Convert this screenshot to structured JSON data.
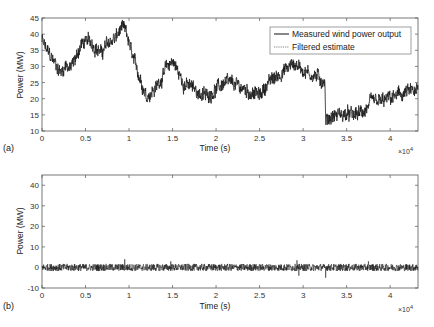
{
  "chart_data": [
    {
      "panel": "(a)",
      "type": "line",
      "xlabel": "Time (s)",
      "ylabel": "Power (MW)",
      "x_multiplier": "×10^4",
      "xlim": [
        0,
        4.32
      ],
      "ylim": [
        10,
        45
      ],
      "xticks": [
        0,
        0.5,
        1,
        1.5,
        2,
        2.5,
        3,
        3.5,
        4
      ],
      "xtick_labels": [
        "0",
        "0.5",
        "1",
        "1.5",
        "2",
        "2.5",
        "3",
        "3.5",
        "4"
      ],
      "yticks": [
        10,
        15,
        20,
        25,
        30,
        35,
        40,
        45
      ],
      "ytick_labels": [
        "10",
        "15",
        "20",
        "25",
        "30",
        "35",
        "40",
        "45"
      ],
      "grid": false,
      "legend": {
        "position": "upper right",
        "entries": [
          {
            "label": "Measured wind power output",
            "style": "solid",
            "color": "#000000"
          },
          {
            "label": "Filtered estimate",
            "style": "dotted",
            "color": "#555555"
          }
        ]
      },
      "series": [
        {
          "name": "Measured wind power output",
          "noise_amplitude": 2.2,
          "x": [
            0,
            0.05,
            0.15,
            0.22,
            0.28,
            0.32,
            0.38,
            0.45,
            0.55,
            0.62,
            0.68,
            0.75,
            0.85,
            0.92,
            0.97,
            1.05,
            1.12,
            1.2,
            1.3,
            1.4,
            1.5,
            1.55,
            1.62,
            1.75,
            1.85,
            1.9,
            2.0,
            2.1,
            2.25,
            2.4,
            2.5,
            2.6,
            2.75,
            2.9,
            2.95,
            3.05,
            3.15,
            3.25,
            3.26,
            3.3,
            3.4,
            3.6,
            3.7,
            3.8,
            3.9,
            4.0,
            4.1,
            4.2,
            4.32
          ],
          "y": [
            38,
            35,
            31,
            28,
            31,
            29,
            32,
            37,
            38,
            36,
            34,
            37,
            39,
            42,
            40,
            32,
            27,
            21,
            23,
            28,
            32,
            29,
            25,
            23,
            21,
            21,
            23,
            25,
            24,
            22,
            21,
            25,
            28,
            31,
            30,
            28,
            27,
            25,
            13,
            14,
            15,
            15,
            16,
            19,
            19,
            20,
            21,
            22,
            22
          ]
        },
        {
          "name": "Filtered estimate",
          "note": "overlaps measured trace"
        }
      ]
    },
    {
      "panel": "(b)",
      "type": "line",
      "xlabel": "Time (s)",
      "ylabel": "Power (MW)",
      "x_multiplier": "×10^4",
      "xlim": [
        0,
        4.32
      ],
      "ylim": [
        -10,
        45
      ],
      "xticks": [
        0,
        0.5,
        1,
        1.5,
        2,
        2.5,
        3,
        3.5,
        4
      ],
      "xtick_labels": [
        "0",
        "0.5",
        "1",
        "1.5",
        "2",
        "2.5",
        "3",
        "3.5",
        "4"
      ],
      "yticks": [
        -10,
        0,
        10,
        20,
        30,
        40
      ],
      "ytick_labels": [
        "-10",
        "0",
        "10",
        "20",
        "30",
        "40"
      ],
      "grid": false,
      "series": [
        {
          "name": "Estimation error (residual)",
          "noise_amplitude": 1.6,
          "x": [
            0,
            4.32
          ],
          "y": [
            0,
            0
          ],
          "spikes": [
            {
              "x": 0.95,
              "y": 4
            },
            {
              "x": 1.48,
              "y": 3
            },
            {
              "x": 2.93,
              "y": 3.5
            },
            {
              "x": 2.95,
              "y": -4
            },
            {
              "x": 3.26,
              "y": -5
            },
            {
              "x": 3.75,
              "y": 3
            }
          ]
        }
      ]
    }
  ],
  "labels": {
    "panel_a": "(a)",
    "panel_b": "(b)",
    "xlabel": "Time (s)",
    "ylabel": "Power (MW)",
    "x_multiplier_base": "×10",
    "x_multiplier_exp": "4",
    "legend_measured": "Measured wind power output",
    "legend_filtered": "Filtered estimate"
  }
}
